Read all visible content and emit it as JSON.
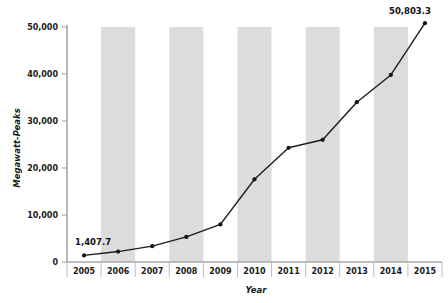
{
  "chart_data": {
    "type": "line",
    "title": "",
    "subtitle": "",
    "xlabel": "Year",
    "ylabel": "Megawatt-Peaks",
    "categories": [
      "2005",
      "2006",
      "2007",
      "2008",
      "2009",
      "2010",
      "2011",
      "2012",
      "2013",
      "2014",
      "2015"
    ],
    "values": [
      1407.7,
      2220,
      3370,
      5340,
      8000,
      17600,
      24300,
      26000,
      34000,
      39800,
      50803.3
    ],
    "series": [
      {
        "name": "Cumulative installed capacity",
        "values": [
          1407.7,
          2220,
          3370,
          5340,
          8000,
          17600,
          24300,
          26000,
          34000,
          39800,
          50803.3
        ]
      }
    ],
    "ylim": [
      0,
      50000
    ],
    "ytick_values": [
      0,
      10000,
      20000,
      30000,
      40000,
      50000
    ],
    "ytick_labels": [
      "0",
      "10,000",
      "20,000",
      "30,000",
      "40,000",
      "50,000"
    ],
    "xtick_labels": [
      "2005",
      "2006",
      "2007",
      "2008",
      "2009",
      "2010",
      "2011",
      "2012",
      "2013",
      "2014",
      "2015"
    ],
    "grid": false,
    "legend": "none",
    "alternating_band_color": "#dcdcdc",
    "line_color": "#1c1c1c",
    "marker_color": "#141414",
    "axis_color": "#a8a8a8",
    "data_labels": [
      {
        "category": "2005",
        "text": "1,407.7",
        "value": 1407.7
      },
      {
        "category": "2015",
        "text": "50,803.3",
        "value": 50803.3
      }
    ],
    "annotations": []
  },
  "axes": {
    "y_title": "Megawatt-Peaks",
    "x_title": "Year"
  },
  "labels": {
    "first_point": "1,407.7",
    "last_point": "50,803.3"
  }
}
